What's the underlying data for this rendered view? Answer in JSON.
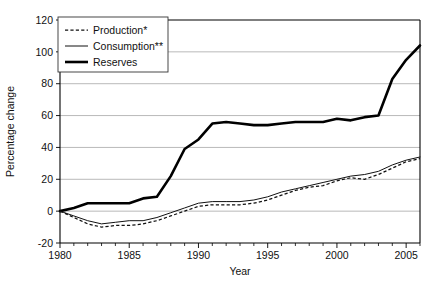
{
  "chart_data": {
    "type": "line",
    "title": "",
    "xlabel": "Year",
    "ylabel": "Percentage change",
    "xlim": [
      1980,
      2006
    ],
    "ylim": [
      -20,
      120
    ],
    "yticks": [
      -20,
      0,
      20,
      40,
      60,
      80,
      100,
      120
    ],
    "xticks": [
      1980,
      1985,
      1990,
      1995,
      2000,
      2005
    ],
    "xtick_labels": [
      "1980",
      "1985",
      "1990",
      "1995",
      "2000",
      "2005"
    ],
    "ytick_labels": [
      "-20",
      "0",
      "20",
      "40",
      "60",
      "80",
      "100",
      "120"
    ],
    "x_minor_ticks_every": 1,
    "grid": "horizontal",
    "legend_position": "top-left",
    "x": [
      1980,
      1981,
      1982,
      1983,
      1984,
      1985,
      1986,
      1987,
      1988,
      1989,
      1990,
      1991,
      1992,
      1993,
      1994,
      1995,
      1996,
      1997,
      1998,
      1999,
      2000,
      2001,
      2002,
      2003,
      2004,
      2005,
      2006
    ],
    "series": [
      {
        "name": "Production*",
        "style": "dashed",
        "values": [
          0,
          -4,
          -8,
          -10,
          -9,
          -9,
          -8,
          -6,
          -3,
          0,
          3,
          4,
          4,
          4,
          5,
          7,
          10,
          13,
          15,
          16,
          19,
          21,
          20,
          23,
          27,
          31,
          33
        ]
      },
      {
        "name": "Consumption**",
        "style": "thin-solid",
        "values": [
          0,
          -3,
          -6,
          -8,
          -7,
          -6,
          -6,
          -4,
          -1,
          2,
          5,
          6,
          6,
          6,
          7,
          9,
          12,
          14,
          16,
          18,
          20,
          22,
          23,
          25,
          29,
          32,
          34
        ]
      },
      {
        "name": "Reserves",
        "style": "thick-solid",
        "values": [
          0,
          2,
          5,
          5,
          5,
          5,
          8,
          9,
          22,
          39,
          45,
          55,
          56,
          55,
          54,
          54,
          55,
          56,
          56,
          56,
          58,
          57,
          59,
          60,
          83,
          95,
          104
        ]
      }
    ]
  },
  "legend": {
    "items": [
      {
        "label": "Production*",
        "style": "dashed"
      },
      {
        "label": "Consumption**",
        "style": "thin-solid"
      },
      {
        "label": "Reserves",
        "style": "thick-solid"
      }
    ]
  },
  "axes": {
    "y_title": "Percentage change",
    "x_title": "Year"
  },
  "colors": {
    "line": "#111111",
    "grid": "#9a9a9a",
    "axis": "#000000",
    "background": "#ffffff"
  }
}
